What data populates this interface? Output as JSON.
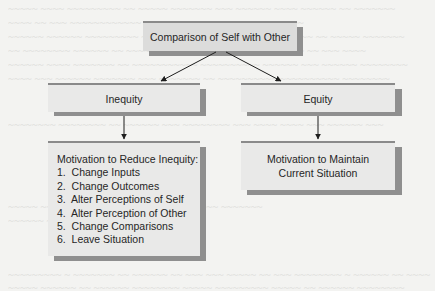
{
  "diagram": {
    "type": "flowchart",
    "nodes": {
      "comparison": {
        "label": "Comparison of Self with Other"
      },
      "inequity": {
        "label": "Inequity"
      },
      "equity": {
        "label": "Equity"
      },
      "reduce_inequity": {
        "title": "Motivation to Reduce Inequity:",
        "items": [
          "1.  Change Inputs",
          "2.  Change Outcomes",
          "3.  Alter Perceptions of Self",
          "4.  Alter Perception of Other",
          "5.  Change Comparisons",
          "6.  Leave Situation"
        ]
      },
      "maintain": {
        "line1": "Motivation to Maintain",
        "line2": "Current Situation"
      }
    },
    "edges": [
      {
        "from": "comparison",
        "to": "inequity"
      },
      {
        "from": "comparison",
        "to": "equity"
      },
      {
        "from": "inequity",
        "to": "reduce_inequity"
      },
      {
        "from": "equity",
        "to": "maintain"
      }
    ]
  },
  "colors": {
    "box_fill": "#dcdcdb",
    "box_fill_light": "#e9e9e8",
    "box_shadow": "#8f8f8f",
    "border_top": "#8a8a8a",
    "arrow": "#1e1e1e",
    "text": "#262626",
    "page": "#f3f3f1"
  }
}
